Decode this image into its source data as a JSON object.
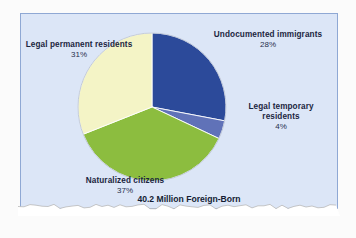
{
  "figure": {
    "caption": "40.2 Million Foreign-Born",
    "panel_background_color": "#dce6f7",
    "panel_border_color": "#8fa8d4"
  },
  "labels": {
    "undocumented": {
      "title": "Undocumented immigrants",
      "percent": "28%"
    },
    "legal_temporary": {
      "title": "Legal temporary residents",
      "percent": "4%"
    },
    "legal_permanent": {
      "title": "Legal permanent residents",
      "percent": "31%"
    },
    "naturalized": {
      "title": "Naturalized citizens",
      "percent": "37%"
    }
  },
  "chart_data": {
    "type": "pie",
    "title": "40.2 Million Foreign-Born",
    "subtitle": "",
    "xlabel": "",
    "ylabel": "",
    "total_label": "40.2 Million Foreign-Born",
    "total_value": 40.2,
    "total_units": "million people",
    "start_angle_deg": 0,
    "direction": "clockwise",
    "legend": "none",
    "grid": false,
    "labels": [
      "Undocumented immigrants",
      "Legal temporary residents",
      "Naturalized citizens",
      "Legal permanent residents"
    ],
    "values": [
      28,
      4,
      37,
      31
    ],
    "value_labels": [
      "28%",
      "4%",
      "37%",
      "31%"
    ],
    "units": "percent",
    "colors": [
      "#2c4a9a",
      "#6072b8",
      "#8cbd3f",
      "#f4f4c6"
    ],
    "slices": [
      {
        "label": "Undocumented immigrants",
        "value": 28,
        "value_label": "28%",
        "color": "#2c4a9a"
      },
      {
        "label": "Legal temporary residents",
        "value": 4,
        "value_label": "4%",
        "color": "#6072b8"
      },
      {
        "label": "Naturalized citizens",
        "value": 37,
        "value_label": "37%",
        "color": "#8cbd3f"
      },
      {
        "label": "Legal permanent residents",
        "value": 31,
        "value_label": "31%",
        "color": "#f4f4c6"
      }
    ]
  }
}
